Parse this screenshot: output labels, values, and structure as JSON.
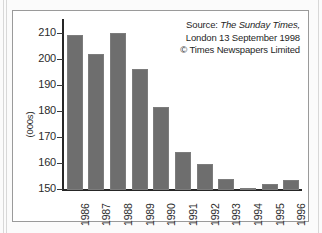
{
  "figure": {
    "source_note": {
      "line1_prefix": "Source: ",
      "line1_italic": "The Sunday Times,",
      "line2": "London 13 September 1998",
      "line3": "© Times Newspapers Limited"
    },
    "colors": {
      "bar_fill": "#6e6e6e",
      "axis": "#262626",
      "frame": "#9a9a9a",
      "background": "#ffffff"
    }
  },
  "chart_data": {
    "type": "bar",
    "title": "",
    "subtitle": "",
    "xlabel": "",
    "ylabel": "(000s)",
    "ylim": [
      150,
      213
    ],
    "yticks": [
      150,
      160,
      170,
      180,
      190,
      200,
      210
    ],
    "ytick_labels": [
      "150",
      "160",
      "170",
      "180",
      "190",
      "200",
      "210"
    ],
    "grid": false,
    "legend": null,
    "categories": [
      "1986",
      "1987",
      "1988",
      "1989",
      "1990",
      "1991",
      "1992",
      "1993",
      "1994",
      "1995",
      "1996"
    ],
    "values": [
      209.5,
      202.5,
      210.5,
      196.5,
      181.8,
      164.5,
      160.0,
      154.2,
      150.8,
      152.2,
      153.8
    ],
    "units": "thousands",
    "annotations": [
      "Source: The Sunday Times, London 13 September 1998",
      "© Times Newspapers Limited"
    ]
  }
}
